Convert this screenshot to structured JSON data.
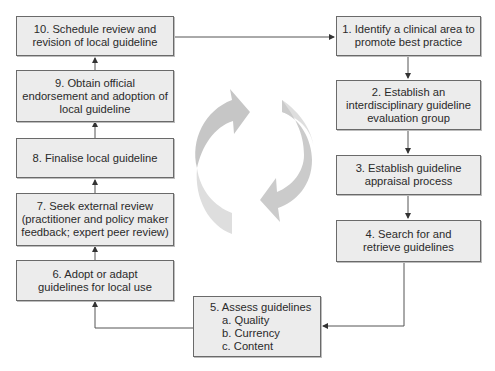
{
  "diagram": {
    "type": "cyclic-process-flowchart",
    "steps": [
      {
        "id": 1,
        "lines": [
          "1. Identify a clinical area to",
          "promote best practice"
        ]
      },
      {
        "id": 2,
        "lines": [
          "2. Establish an",
          "interdisciplinary guideline",
          "evaluation group"
        ]
      },
      {
        "id": 3,
        "lines": [
          "3. Establish guideline",
          "appraisal process"
        ]
      },
      {
        "id": 4,
        "lines": [
          "4. Search for and",
          "retrieve guidelines"
        ]
      },
      {
        "id": 5,
        "lines": [
          "5. Assess guidelines"
        ],
        "sublines": [
          "a. Quality",
          "b. Currency",
          "c. Content"
        ]
      },
      {
        "id": 6,
        "lines": [
          "6. Adopt or adapt",
          "guidelines for local use"
        ]
      },
      {
        "id": 7,
        "lines": [
          "7. Seek external review",
          "(practitioner and policy maker",
          "feedback; expert peer review)"
        ]
      },
      {
        "id": 8,
        "lines": [
          "8. Finalise local guideline"
        ]
      },
      {
        "id": 9,
        "lines": [
          "9. Obtain official",
          "endorsement and adoption of",
          "local guideline"
        ]
      },
      {
        "id": 10,
        "lines": [
          "10. Schedule review and",
          "revision of local guideline"
        ]
      }
    ],
    "edges": [
      [
        "10",
        "1"
      ],
      [
        "1",
        "2"
      ],
      [
        "2",
        "3"
      ],
      [
        "3",
        "4"
      ],
      [
        "4",
        "5"
      ],
      [
        "5",
        "6"
      ],
      [
        "6",
        "7"
      ],
      [
        "7",
        "8"
      ],
      [
        "8",
        "9"
      ],
      [
        "9",
        "10"
      ]
    ],
    "center_icon": "cycle-arrows-icon",
    "colors": {
      "box_fill": "#ececec",
      "box_border": "#6a6a6a",
      "connector": "#555555",
      "cycle_arrow_dark": "#c4c4c4",
      "cycle_arrow_light": "#dcdcdc"
    }
  }
}
